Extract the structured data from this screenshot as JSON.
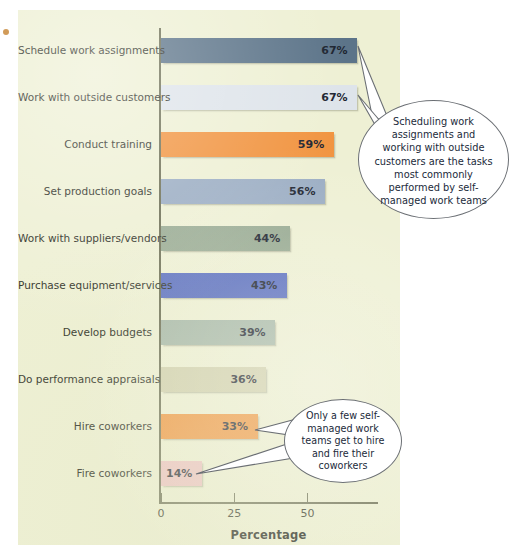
{
  "chart_data": {
    "type": "bar",
    "orientation": "horizontal",
    "title": "",
    "xlabel": "Percentage",
    "ylabel": "",
    "xlim": [
      0,
      75
    ],
    "xticks": [
      0,
      25,
      50
    ],
    "xtick_labels": [
      "0",
      "25",
      "50"
    ],
    "grid": false,
    "legend": "none",
    "categories": [
      "Schedule work assignments",
      "Work with outside customers",
      "Conduct training",
      "Set production goals",
      "Work with suppliers/vendors",
      "Purchase equipment/services",
      "Develop budgets",
      "Do performance appraisals",
      "Hire coworkers",
      "Fire coworkers"
    ],
    "values": [
      67,
      67,
      59,
      56,
      44,
      43,
      39,
      36,
      33,
      14
    ],
    "value_labels": [
      "67%",
      "67%",
      "59%",
      "56%",
      "44%",
      "43%",
      "39%",
      "36%",
      "33%",
      "14%"
    ],
    "bar_colors": [
      "#5c7489",
      "#dee4ea",
      "#f19440",
      "#9badc3",
      "#99ab93",
      "#5b6fc0",
      "#a8b9a9",
      "#d2d1af",
      "#f09640",
      "#edc2c2"
    ],
    "annotations": [
      "Scheduling work assignments and working with outside customers are the tasks most commonly performed by self-managed work teams",
      "Only a few self-managed work teams get to hire and fire their coworkers"
    ]
  },
  "panel": {
    "background": "#eef0d4",
    "axis_color": "#6d6f55"
  },
  "callouts": [
    {
      "id": "callout-1",
      "text": "Scheduling work assignments and working with outside customers are the tasks most commonly performed by self-managed work teams",
      "points_to": [
        "Schedule work assignments",
        "Work with outside customers"
      ]
    },
    {
      "id": "callout-2",
      "text": "Only a few self-managed work teams get to hire and fire their coworkers",
      "points_to": [
        "Hire coworkers",
        "Fire coworkers"
      ]
    }
  ]
}
